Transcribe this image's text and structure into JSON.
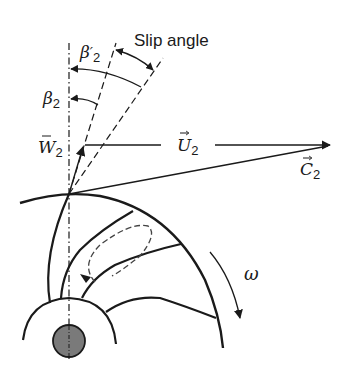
{
  "diagram": {
    "type": "centrifugal-impeller-velocity-triangle",
    "labels": {
      "slip_angle": "Slip angle",
      "beta2_prime": {
        "symbol": "β",
        "prime": "′",
        "subscript": "2"
      },
      "beta2": {
        "symbol": "β",
        "subscript": "2"
      },
      "w2": {
        "symbol": "W",
        "subscript": "2",
        "vector": true
      },
      "u2": {
        "symbol": "U",
        "subscript": "2",
        "vector": true
      },
      "c2": {
        "symbol": "C",
        "subscript": "2",
        "vector": true
      },
      "omega": "ω"
    },
    "colors": {
      "stroke": "#1a1a1a",
      "hub_fill": "#7a7a7a",
      "background": "#ffffff"
    }
  }
}
